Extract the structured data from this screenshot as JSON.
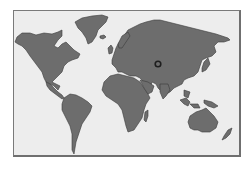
{
  "map": {
    "type": "world-map",
    "projection": "equirectangular-style",
    "background_color": "#ededed",
    "land_color": "#6d6d6d",
    "border_color": "#7a7a7a",
    "continents": [
      {
        "name": "North America"
      },
      {
        "name": "Greenland"
      },
      {
        "name": "South America"
      },
      {
        "name": "Europe"
      },
      {
        "name": "Africa"
      },
      {
        "name": "Asia"
      },
      {
        "name": "Australia"
      },
      {
        "name": "Madagascar"
      },
      {
        "name": "Japan"
      },
      {
        "name": "New Zealand"
      },
      {
        "name": "Indonesia"
      },
      {
        "name": "New Guinea"
      },
      {
        "name": "British Isles"
      },
      {
        "name": "Iceland"
      }
    ],
    "marker": {
      "shape": "ring",
      "color": "#1e1e1e",
      "region": "Central Asia",
      "x": 158,
      "y": 64
    }
  }
}
